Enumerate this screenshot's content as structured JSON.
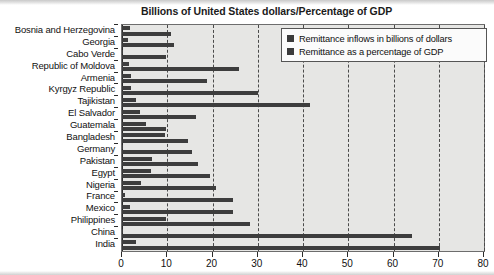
{
  "chart_data": {
    "type": "bar",
    "orientation": "horizontal",
    "title": "Billions of United States dollars/Percentage of GDP",
    "xlabel": "",
    "ylabel": "",
    "xlim": [
      0,
      80
    ],
    "xticks": [
      0,
      10,
      20,
      30,
      40,
      50,
      60,
      70,
      80
    ],
    "grid": true,
    "legend_position": "top-right",
    "categories": [
      "Bosnia and Herzegovina",
      "Georgia",
      "Cabo Verde",
      "Republic of Moldova",
      "Armenia",
      "Kyrgyz Republic",
      "Tajikistan",
      "El Salvador",
      "Guatemala",
      "Bangladesh",
      "Germany",
      "Pakistan",
      "Egypt",
      "Nigeria",
      "France",
      "Mexico",
      "Philippines",
      "China",
      "India"
    ],
    "series": [
      {
        "name": "Remittance inflows in billions of dollars",
        "color": "#3d3d3d",
        "values": [
          1.8,
          1.4,
          0.2,
          1.6,
          1.9,
          2.0,
          3.2,
          4.0,
          5.4,
          9.4,
          0.3,
          6.7,
          6.5,
          4.2,
          0.7,
          1.7,
          9.8,
          0.3,
          3.1
        ]
      },
      {
        "name": "Remittance as a percentage of GDP",
        "color": "#3d3d3d",
        "values": [
          10.8,
          11.5,
          9.8,
          25.8,
          18.7,
          30.0,
          41.5,
          16.3,
          9.8,
          14.5,
          15.5,
          16.8,
          19.5,
          20.8,
          24.5,
          24.5,
          28.2,
          64.0,
          70.3
        ]
      }
    ]
  },
  "legend": {
    "items": [
      {
        "label": "Remittance inflows in billions of dollars",
        "swatch": "legend-swatch-icon"
      },
      {
        "label": "Remittance as a percentage of GDP",
        "swatch": "legend-swatch-icon"
      }
    ]
  }
}
